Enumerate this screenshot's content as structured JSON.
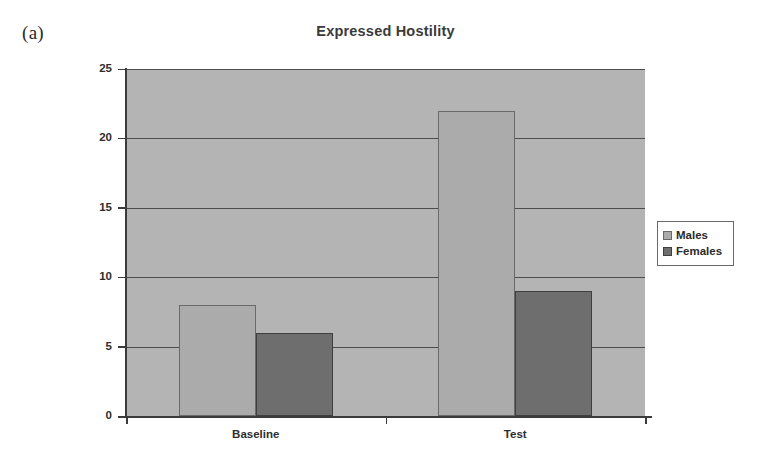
{
  "figure": {
    "panel_label": "(a)"
  },
  "chart_data": {
    "type": "bar",
    "title": "Expressed Hostility",
    "xlabel": "",
    "ylabel": "",
    "categories": [
      "Baseline",
      "Test"
    ],
    "series": [
      {
        "name": "Males",
        "values": [
          8,
          22
        ],
        "color": "#ababab"
      },
      {
        "name": "Females",
        "values": [
          6,
          9
        ],
        "color": "#6e6e6e"
      }
    ],
    "ylim": [
      0,
      25
    ],
    "yticks": [
      0,
      5,
      10,
      15,
      20,
      25
    ],
    "ytick_labels": [
      "0",
      "5",
      "10",
      "15",
      "20",
      "25"
    ],
    "grid": true,
    "grid_axis": "y",
    "legend": {
      "position": "right",
      "entries": [
        "Males",
        "Females"
      ]
    },
    "plot_background": "#b4b4b4",
    "grid_color": "#4d4d4d",
    "axis_color": "#3b3b3b"
  }
}
